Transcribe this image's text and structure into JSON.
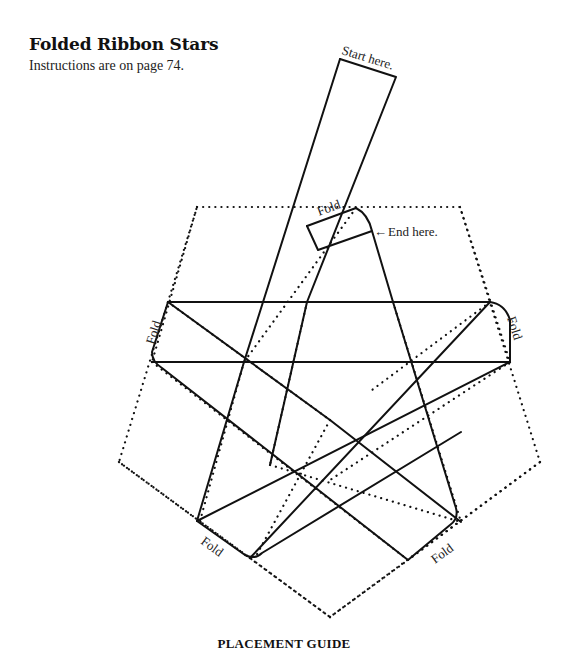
{
  "header": {
    "title": "Folded Ribbon Stars",
    "subtitle": "Instructions are on page 74."
  },
  "caption": "PLACEMENT GUIDE",
  "labels": {
    "start": "Start here.",
    "end": "End here.",
    "fold": "Fold",
    "end_arrow": "←"
  },
  "diagram": {
    "dotted_pentagon": "197,207 460,207 540,462 330,617 119,462 197,207",
    "dotted_inner": [
      "152,362 510,362",
      "168,302 490,302",
      "197,207 152,362",
      "460,207 510,362",
      "119,462 250,558",
      "540,462 408,560",
      "330,617 250,558",
      "330,617 408,560",
      "356,208 244,362",
      "307,302 270,465",
      "244,362 200,521",
      "393,302 461,522",
      "490,302 372,390",
      "510,362 330,480",
      "152,362 408,560",
      "168,302 330,420",
      "270,465 461,522",
      "330,420 255,558"
    ],
    "solid_paths": [
      "M340,59 L396,77 L307,302",
      "M340,59 L244,362",
      "M307,226 L356,208 Q368,214 372,231 L393,302",
      "M307,226 L318,250 L372,231",
      "M168,302 L490,302 Q505,304 510,320 L510,362",
      "M168,302 L152,352 Q152,362 162,368 L408,560",
      "M152,362 L510,362",
      "M168,302 L330,420",
      "M510,362 L197,521",
      "M490,302 L250,558",
      "M244,362 L197,521 L245,555 Q255,560 262,553 L461,432",
      "M393,302 L455,505 Q460,518 450,525 L408,560",
      "M307,302 L270,465",
      "M330,420 L461,522"
    ]
  }
}
